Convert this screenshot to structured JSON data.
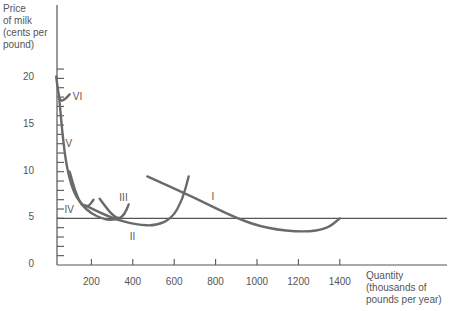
{
  "chart_data": {
    "type": "line",
    "title": "",
    "ylabel": "Price of milk (cents per pound)",
    "xlabel": "Quantity (thousands of pounds per year)",
    "ylabel_lines": [
      "Price",
      "of milk",
      "(cents per",
      "pound)"
    ],
    "xlabel_lines": [
      "Quantity",
      "(thousands of",
      "pounds per year)"
    ],
    "xlim": [
      0,
      1900
    ],
    "ylim": [
      0,
      25
    ],
    "x_ticks": [
      200,
      400,
      600,
      800,
      1000,
      1200,
      1400
    ],
    "x_tick_labels": [
      "200",
      "400",
      "600",
      "800",
      "1000",
      "1200",
      "1400"
    ],
    "y_ticks": [
      0,
      5,
      10,
      15,
      20
    ],
    "y_tick_labels": [
      "0",
      "5",
      "10",
      "15",
      "20"
    ],
    "y_minor_ticks_every": 1,
    "reference_line": {
      "y": 5,
      "label": "price line"
    },
    "grid": false,
    "legend": null,
    "series": [
      {
        "name": "I",
        "points": [
          [
            470,
            9.5
          ],
          [
            700,
            7.2
          ],
          [
            900,
            5.0
          ],
          [
            1050,
            3.9
          ],
          [
            1230,
            3.5
          ],
          [
            1340,
            3.9
          ],
          [
            1400,
            5.0
          ]
        ]
      },
      {
        "name": "II",
        "points": [
          [
            170,
            6.4
          ],
          [
            300,
            5.0
          ],
          [
            420,
            4.3
          ],
          [
            510,
            4.2
          ],
          [
            590,
            5.0
          ],
          [
            640,
            7.0
          ],
          [
            670,
            9.5
          ]
        ]
      },
      {
        "name": "III",
        "points": [
          [
            240,
            7.1
          ],
          [
            290,
            5.6
          ],
          [
            330,
            4.9
          ],
          [
            360,
            5.4
          ],
          [
            380,
            6.5
          ]
        ]
      },
      {
        "name": "IV",
        "points": [
          [
            95,
            10.0
          ],
          [
            120,
            8.0
          ],
          [
            150,
            6.5
          ],
          [
            185,
            6.2
          ],
          [
            210,
            7.0
          ]
        ]
      },
      {
        "name": "V",
        "points": [
          [
            45,
            17.8
          ],
          [
            60,
            14.0
          ],
          [
            80,
            10.5
          ],
          [
            110,
            8.0
          ],
          [
            150,
            6.5
          ],
          [
            200,
            5.5
          ],
          [
            250,
            5.0
          ],
          [
            290,
            4.8
          ],
          [
            340,
            5.0
          ]
        ]
      },
      {
        "name": "VI",
        "points": [
          [
            30,
            20.2
          ],
          [
            40,
            18.5
          ],
          [
            50,
            17.5
          ],
          [
            75,
            17.8
          ],
          [
            95,
            18.3
          ]
        ]
      }
    ],
    "series_labels": [
      {
        "name": "I",
        "x": 780,
        "y": 7.3
      },
      {
        "name": "II",
        "x": 385,
        "y": 3.0
      },
      {
        "name": "III",
        "x": 335,
        "y": 7.2
      },
      {
        "name": "IV",
        "x": 70,
        "y": 5.9
      },
      {
        "name": "V",
        "x": 75,
        "y": 13.0
      },
      {
        "name": "VI",
        "x": 110,
        "y": 18.0
      }
    ]
  },
  "render": {
    "origin_px": [
      50,
      265
    ],
    "px_per_unit_x": 0.207,
    "px_per_unit_y": 9.33,
    "yaxis_x_px": 57,
    "plot_right_px": 447,
    "yaxis_top_px": 5,
    "curve_color": "#6a6a6a",
    "axis_color": "#555555"
  }
}
